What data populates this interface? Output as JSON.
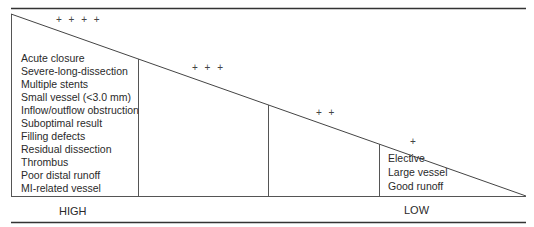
{
  "diagram": {
    "high_label": "HIGH",
    "low_label": "LOW",
    "high_risk_factors": [
      "Acute closure",
      "Severe-long-dissection",
      "Multiple stents",
      "Small vessel (<3.0 mm)",
      "Inflow/outflow obstruction",
      "Suboptimal result",
      "Filling defects",
      "Residual dissection",
      "Thrombus",
      "Poor distal runoff",
      "MI-related vessel",
      "Other factors"
    ],
    "low_risk_factors": [
      "Elective",
      "Large vessel",
      "Good runoff"
    ],
    "risk_markers": [
      "+ + + +",
      "+ + +",
      "+ +",
      "+"
    ]
  }
}
